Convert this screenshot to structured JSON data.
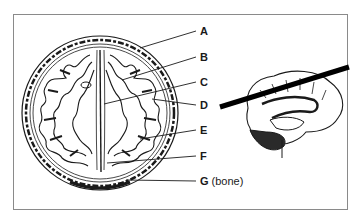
{
  "figure": {
    "type": "anatomical-diagram",
    "left_panel": "horizontal (axial) section of brain within skull",
    "right_panel": "medial view of brain hemisphere with black cutting-plane bar",
    "labels": [
      {
        "id": "A",
        "text": "A"
      },
      {
        "id": "B",
        "text": "B"
      },
      {
        "id": "C",
        "text": "C"
      },
      {
        "id": "D",
        "text": "D"
      },
      {
        "id": "E",
        "text": "E"
      },
      {
        "id": "F",
        "text": "F"
      },
      {
        "id": "G",
        "text": "G",
        "note": "(bone)"
      }
    ],
    "colors": {
      "line": "#1a1a1a",
      "frame": "#8a8a8a",
      "background": "#ffffff"
    }
  }
}
